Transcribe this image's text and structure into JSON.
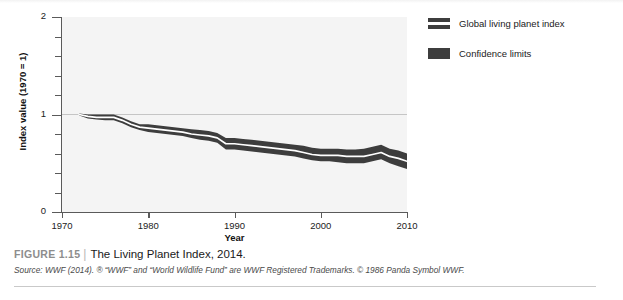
{
  "figure": {
    "label": "FIGURE 1.15",
    "divider": "|",
    "title": "The Living Planet Index, 2014.",
    "source": "Source: WWF (2014). ® “WWF” and “World Wildlife Fund” are WWF Registered Trademarks. © 1986 Panda Symbol WWF."
  },
  "legend": {
    "position": "right",
    "items": [
      {
        "label": "Global living planet index",
        "swatch": "line-with-band",
        "color": "#3d3d3d"
      },
      {
        "label": "Confidence limits",
        "swatch": "solid-band",
        "color": "#3d3d3d"
      }
    ]
  },
  "colors": {
    "plot_background": "#f4f4f4",
    "band": "#3d3d3d",
    "line": "#ffffff",
    "axis": "#5a5a5a",
    "gridline": "#c0c0c0",
    "figure_label": "#8d8d8d"
  },
  "chart_data": {
    "type": "line",
    "title": "The Living Planet Index, 2014.",
    "xlabel": "Year",
    "ylabel": "Index value (1970 = 1)",
    "xlim": [
      1970,
      2010
    ],
    "ylim": [
      0,
      2
    ],
    "grid": "horizontal-at-1-only",
    "x_major_ticks": [
      1970,
      1980,
      1990,
      2000,
      2010
    ],
    "x_tick_labels": [
      "1970",
      "1980",
      "1990",
      "2000",
      "2010"
    ],
    "y_major_ticks": [
      0,
      1,
      2
    ],
    "y_tick_labels": [
      "0",
      "1",
      "2"
    ],
    "y_minor_ticks": [
      0.2,
      0.4,
      0.6,
      0.8,
      1.2,
      1.4,
      1.6,
      1.8
    ],
    "gridlines_y": [
      1
    ],
    "x": [
      1972,
      1973,
      1974,
      1975,
      1976,
      1977,
      1978,
      1979,
      1980,
      1981,
      1982,
      1983,
      1984,
      1985,
      1986,
      1987,
      1988,
      1989,
      1990,
      1991,
      1992,
      1993,
      1994,
      1995,
      1996,
      1997,
      1998,
      1999,
      2000,
      2001,
      2002,
      2003,
      2004,
      2005,
      2006,
      2007,
      2008,
      2009,
      2010
    ],
    "series": [
      {
        "name": "Global living planet index",
        "values": [
          1.0,
          0.98,
          0.97,
          0.97,
          0.97,
          0.94,
          0.9,
          0.87,
          0.86,
          0.85,
          0.84,
          0.83,
          0.82,
          0.8,
          0.79,
          0.78,
          0.76,
          0.7,
          0.7,
          0.69,
          0.68,
          0.67,
          0.66,
          0.65,
          0.64,
          0.63,
          0.61,
          0.59,
          0.58,
          0.58,
          0.58,
          0.57,
          0.57,
          0.57,
          0.59,
          0.61,
          0.57,
          0.55,
          0.52
        ]
      },
      {
        "name": "Confidence limits upper",
        "values": [
          1.01,
          1.0,
          1.0,
          1.0,
          1.0,
          0.97,
          0.93,
          0.9,
          0.9,
          0.89,
          0.88,
          0.87,
          0.86,
          0.85,
          0.84,
          0.83,
          0.81,
          0.76,
          0.76,
          0.75,
          0.74,
          0.73,
          0.72,
          0.71,
          0.7,
          0.69,
          0.68,
          0.66,
          0.65,
          0.65,
          0.65,
          0.64,
          0.64,
          0.65,
          0.67,
          0.69,
          0.65,
          0.63,
          0.6
        ]
      },
      {
        "name": "Confidence limits lower",
        "values": [
          0.99,
          0.96,
          0.95,
          0.94,
          0.94,
          0.91,
          0.87,
          0.84,
          0.82,
          0.81,
          0.8,
          0.79,
          0.78,
          0.76,
          0.74,
          0.73,
          0.71,
          0.64,
          0.64,
          0.63,
          0.62,
          0.61,
          0.6,
          0.59,
          0.58,
          0.57,
          0.55,
          0.53,
          0.52,
          0.52,
          0.51,
          0.5,
          0.5,
          0.5,
          0.52,
          0.54,
          0.5,
          0.47,
          0.44
        ]
      }
    ]
  }
}
